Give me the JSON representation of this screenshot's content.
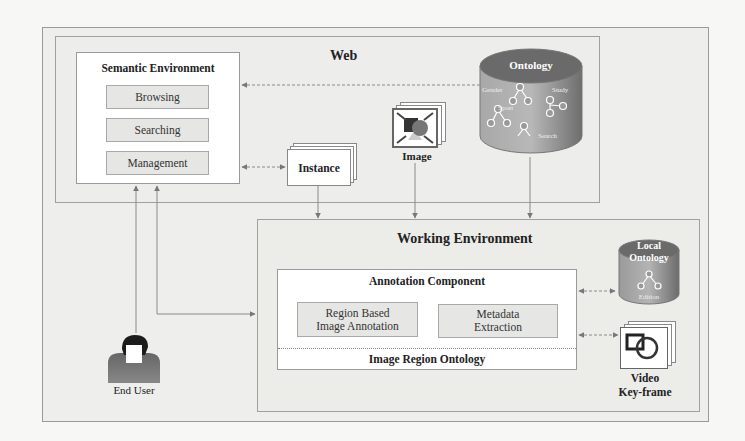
{
  "web": {
    "title": "Web"
  },
  "semantic_environment": {
    "title": "Semantic Environment",
    "items": [
      {
        "label": "Browsing"
      },
      {
        "label": "Searching"
      },
      {
        "label": "Management"
      }
    ]
  },
  "instance": {
    "label": "Instance"
  },
  "image": {
    "label": "Image"
  },
  "ontology": {
    "title": "Ontology",
    "sublabels": [
      "Gender",
      "Study",
      "Sport",
      "Search"
    ]
  },
  "working_environment": {
    "title": "Working Environment"
  },
  "annotation_component": {
    "title": "Annotation Component",
    "region_box": {
      "line1": "Region Based",
      "line2": "Image Annotation"
    },
    "metadata_box": {
      "line1": "Metadata",
      "line2": "Extraction"
    },
    "footer": "Image Region Ontology"
  },
  "local_ontology": {
    "line1": "Local",
    "line2": "Ontology",
    "sublabel": "Edition"
  },
  "video_keyframe": {
    "line1": "Video",
    "line2": "Key-frame"
  },
  "end_user": {
    "label": "End User"
  },
  "colors": {
    "line": "#8a8a8a",
    "cylinder_top": "#6e6e6e",
    "cylinder_body": "#9c9c9c",
    "box_fill": "#e6e6e4"
  }
}
